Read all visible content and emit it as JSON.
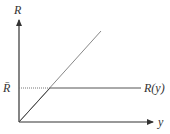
{
  "diagram": {
    "axes": {
      "vertical_label": "R",
      "horizontal_label": "y"
    },
    "level_label": "R̄",
    "curve_label": "R(y)",
    "colors": {
      "axis": "#333333",
      "diagonal": "#888888",
      "level_line": "#555555",
      "dotted": "#777777"
    }
  }
}
